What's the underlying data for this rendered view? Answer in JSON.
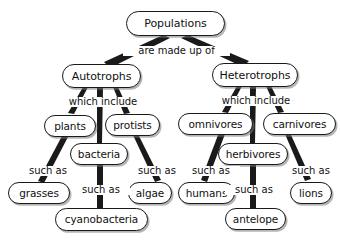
{
  "diagram": {
    "type": "concept-map",
    "title_node": "Populations",
    "colors": {
      "background": "#ffffff",
      "node_fill": "#ffffff",
      "node_stroke": "#1a1a1a",
      "text": "#111111",
      "edge": "#1a1a1a",
      "shadow": "#787878"
    },
    "nodes": {
      "populations": "Populations",
      "autotrophs": "Autotrophs",
      "heterotrophs": "Heterotrophs",
      "plants": "plants",
      "protists": "protists",
      "bacteria": "bacteria",
      "grasses": "grasses",
      "algae": "algae",
      "cyanobacteria": "cyanobacteria",
      "omnivores": "omnivores",
      "carnivores": "carnivores",
      "herbivores": "herbivores",
      "humans": "humans",
      "lions": "lions",
      "antelope": "antelope"
    },
    "link_labels": {
      "are_made_up_of": "are made up of",
      "which_include_left": "which include",
      "which_include_right": "which include",
      "such_as_grasses": "such as",
      "such_as_algae": "such as",
      "such_as_cyanobacteria": "such as",
      "such_as_humans": "such as",
      "such_as_lions": "such as",
      "such_as_antelope": "such as"
    },
    "relationships": [
      {
        "from": "Populations",
        "label": "are made up of",
        "to": "Autotrophs"
      },
      {
        "from": "Populations",
        "label": "are made up of",
        "to": "Heterotrophs"
      },
      {
        "from": "Autotrophs",
        "label": "which include",
        "to": "plants"
      },
      {
        "from": "Autotrophs",
        "label": "which include",
        "to": "bacteria"
      },
      {
        "from": "Autotrophs",
        "label": "which include",
        "to": "protists"
      },
      {
        "from": "plants",
        "label": "such as",
        "to": "grasses"
      },
      {
        "from": "protists",
        "label": "such as",
        "to": "algae"
      },
      {
        "from": "bacteria",
        "label": "such as",
        "to": "cyanobacteria"
      },
      {
        "from": "Heterotrophs",
        "label": "which include",
        "to": "omnivores"
      },
      {
        "from": "Heterotrophs",
        "label": "which include",
        "to": "herbivores"
      },
      {
        "from": "Heterotrophs",
        "label": "which include",
        "to": "carnivores"
      },
      {
        "from": "omnivores",
        "label": "such as",
        "to": "humans"
      },
      {
        "from": "carnivores",
        "label": "such as",
        "to": "lions"
      },
      {
        "from": "herbivores",
        "label": "such as",
        "to": "antelope"
      }
    ]
  }
}
